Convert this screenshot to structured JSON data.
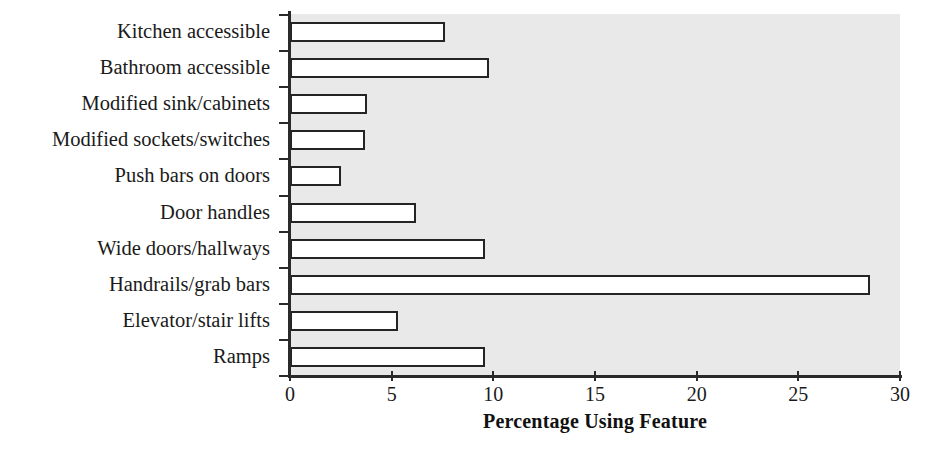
{
  "chart_data": {
    "type": "bar",
    "orientation": "horizontal",
    "title": "",
    "xlabel": "Percentage Using Feature",
    "ylabel": "",
    "xlim": [
      0,
      30
    ],
    "xticks": [
      0,
      5,
      10,
      15,
      20,
      25,
      30
    ],
    "xtick_labels": [
      "0",
      "5",
      "10",
      "15",
      "20",
      "25",
      "30"
    ],
    "grid": false,
    "legend": null,
    "plot_background": "#e9e9e9",
    "bar_fill": "#ffffff",
    "bar_edge": "#242424",
    "categories": [
      "Kitchen accessible",
      "Bathroom accessible",
      "Modified sink/cabinets",
      "Modified sockets/switches",
      "Push bars on doors",
      "Door handles",
      "Wide doors/hallways",
      "Handrails/grab bars",
      "Elevator/stair lifts",
      "Ramps"
    ],
    "values": [
      7.6,
      9.8,
      3.8,
      3.7,
      2.5,
      6.2,
      9.6,
      28.5,
      5.3,
      9.6
    ],
    "bars": [
      {
        "category": "Kitchen accessible",
        "value": 7.6
      },
      {
        "category": "Bathroom accessible",
        "value": 9.8
      },
      {
        "category": "Modified sink/cabinets",
        "value": 3.8
      },
      {
        "category": "Modified sockets/switches",
        "value": 3.7
      },
      {
        "category": "Push bars on doors",
        "value": 2.5
      },
      {
        "category": "Door handles",
        "value": 6.2
      },
      {
        "category": "Wide doors/hallways",
        "value": 9.6
      },
      {
        "category": "Handrails/grab bars",
        "value": 28.5
      },
      {
        "category": "Elevator/stair lifts",
        "value": 5.3
      },
      {
        "category": "Ramps",
        "value": 9.6
      }
    ]
  }
}
